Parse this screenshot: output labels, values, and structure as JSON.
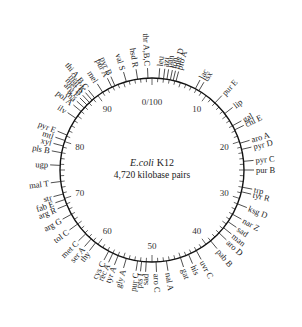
{
  "diagram": {
    "title_organism": "E.coli",
    "title_strain": "K12",
    "subtitle": "4,720 kilobase pairs",
    "origin_label": "0/100",
    "scale_labels": [
      {
        "pos": 10,
        "text": "10"
      },
      {
        "pos": 20,
        "text": "20"
      },
      {
        "pos": 30,
        "text": "30"
      },
      {
        "pos": 40,
        "text": "40"
      },
      {
        "pos": 50,
        "text": "50"
      },
      {
        "pos": 60,
        "text": "60"
      },
      {
        "pos": 70,
        "text": "70"
      },
      {
        "pos": 80,
        "text": "80"
      },
      {
        "pos": 90,
        "text": "90"
      }
    ],
    "genes": [
      {
        "pos": 99.3,
        "label": "thr A,B,C"
      },
      {
        "pos": 1.2,
        "label": "leu"
      },
      {
        "pos": 2.0,
        "label": "azi"
      },
      {
        "pos": 2.6,
        "label": "pan"
      },
      {
        "pos": 3.2,
        "label": "lon"
      },
      {
        "pos": 3.7,
        "label": "met D"
      },
      {
        "pos": 4.2,
        "label": "pro A"
      },
      {
        "pos": 7.8,
        "label": "lac"
      },
      {
        "pos": 8.5,
        "label": "tsx"
      },
      {
        "pos": 12.0,
        "label": "pur E"
      },
      {
        "pos": 14.5,
        "label": "lip"
      },
      {
        "pos": 17.0,
        "label": "gal"
      },
      {
        "pos": 17.8,
        "label": "chl E"
      },
      {
        "pos": 20.3,
        "label": "aro A"
      },
      {
        "pos": 21.4,
        "label": "pyr D"
      },
      {
        "pos": 23.5,
        "label": "pyr C"
      },
      {
        "pos": 25.0,
        "label": "pur B"
      },
      {
        "pos": 28.0,
        "label": "trp"
      },
      {
        "pos": 28.8,
        "label": "tyr R"
      },
      {
        "pos": 31.0,
        "label": "ksg D"
      },
      {
        "pos": 33.0,
        "label": "nar Z"
      },
      {
        "pos": 34.5,
        "label": "sad"
      },
      {
        "pos": 35.8,
        "label": "man"
      },
      {
        "pos": 37.0,
        "label": "aro D"
      },
      {
        "pos": 39.0,
        "label": "pab B"
      },
      {
        "pos": 42.0,
        "label": "uvr C"
      },
      {
        "pos": 43.5,
        "label": "his"
      },
      {
        "pos": 45.0,
        "label": "gat"
      },
      {
        "pos": 47.5,
        "label": "nal A"
      },
      {
        "pos": 49.3,
        "label": "aro C"
      },
      {
        "pos": 51.0,
        "label": "sad"
      },
      {
        "pos": 51.8,
        "label": "pts I"
      },
      {
        "pos": 52.5,
        "label": "pur C"
      },
      {
        "pos": 54.5,
        "label": "gly A"
      },
      {
        "pos": 56.0,
        "label": "tyr A"
      },
      {
        "pos": 57.0,
        "label": "rec A"
      },
      {
        "pos": 57.8,
        "label": "cys C"
      },
      {
        "pos": 60.5,
        "label": "thy"
      },
      {
        "pos": 61.5,
        "label": "ser A"
      },
      {
        "pos": 62.8,
        "label": "met C"
      },
      {
        "pos": 65.0,
        "label": "tol C"
      },
      {
        "pos": 67.0,
        "label": "arg G"
      },
      {
        "pos": 68.8,
        "label": "arg R"
      },
      {
        "pos": 69.8,
        "label": "fab E"
      },
      {
        "pos": 70.8,
        "label": "str"
      },
      {
        "pos": 73.0,
        "label": "mal T"
      },
      {
        "pos": 75.8,
        "label": "ugp"
      },
      {
        "pos": 78.0,
        "label": "pls B"
      },
      {
        "pos": 79.2,
        "label": "xyl"
      },
      {
        "pos": 80.2,
        "label": "mtl"
      },
      {
        "pos": 81.2,
        "label": "pyr E"
      },
      {
        "pos": 84.5,
        "label": "ilv"
      },
      {
        "pos": 86.0,
        "label": "pol A"
      },
      {
        "pos": 86.8,
        "label": "rha"
      },
      {
        "pos": 87.5,
        "label": "arg E"
      },
      {
        "pos": 88.1,
        "label": "met B"
      },
      {
        "pos": 88.7,
        "label": "mal K"
      },
      {
        "pos": 89.3,
        "label": "thi A,B,C"
      },
      {
        "pos": 91.0,
        "label": "mel"
      },
      {
        "pos": 92.8,
        "label": "pur A"
      },
      {
        "pos": 93.4,
        "label": "pyr B"
      },
      {
        "pos": 95.5,
        "label": "val S"
      },
      {
        "pos": 97.5,
        "label": "hsd R"
      }
    ]
  }
}
